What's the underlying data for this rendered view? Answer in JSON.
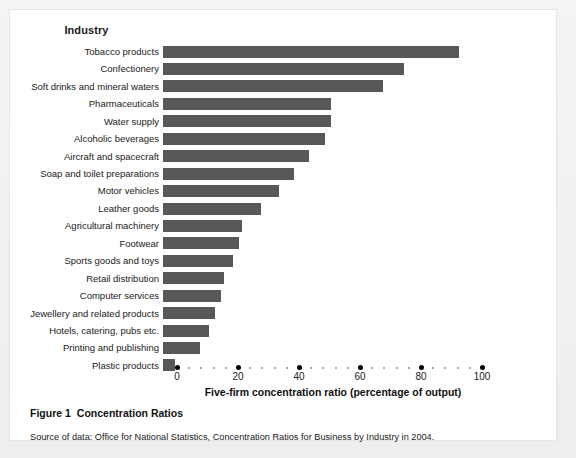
{
  "figure": {
    "caption_number": "Figure 1",
    "caption_title": "Concentration Ratios",
    "source_note": "Source of data: Office for National Statistics, Concentration Ratios for Business by Industry in 2004."
  },
  "chart_data": {
    "type": "bar",
    "orientation": "horizontal",
    "category_axis_heading": "Industry",
    "xlabel": "Five-firm concentration ratio (percentage of output)",
    "ylabel": "Industry",
    "xlim": [
      0,
      100
    ],
    "xticks": [
      0,
      20,
      40,
      60,
      80,
      100
    ],
    "xtick_labels": [
      "0",
      "20",
      "40",
      "60",
      "80",
      "100"
    ],
    "minor_tick_step": 4,
    "grid": false,
    "legend": false,
    "bar_color": "#585858",
    "categories": [
      "Tobacco products",
      "Confectionery",
      "Soft drinks and mineral waters",
      "Pharmaceuticals",
      "Water supply",
      "Alcoholic beverages",
      "Aircraft and spacecraft",
      "Soap and toilet preparations",
      "Motor vehicles",
      "Leather goods",
      "Agricultural machinery",
      "Footwear",
      "Sports goods and toys",
      "Retail distribution",
      "Computer services",
      "Jewellery and related products",
      "Hotels, catering, pubs etc.",
      "Printing and publishing",
      "Plastic products"
    ],
    "values": [
      97,
      79,
      72,
      55,
      55,
      53,
      48,
      43,
      38,
      32,
      26,
      25,
      23,
      20,
      19,
      17,
      15,
      12,
      4
    ]
  }
}
